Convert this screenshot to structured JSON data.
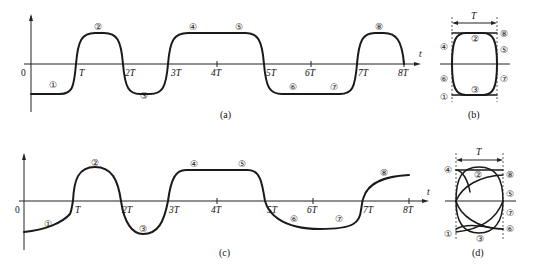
{
  "figure": {
    "panels": [
      {
        "id": "a",
        "caption": "(a)",
        "description": "Square-like wave with rounded transitions, time axis t"
      },
      {
        "id": "b",
        "caption": "(b)",
        "description": "Eye diagram overlay of one period T, rounded rectangle"
      },
      {
        "id": "c",
        "caption": "(c)",
        "description": "Distorted waveform with asymmetric transitions"
      },
      {
        "id": "d",
        "caption": "(d)",
        "description": "Eye diagram overlay of distorted waveform, period T"
      }
    ],
    "axis": {
      "origin": "0",
      "t_label": "t",
      "ticks": [
        "T",
        "2T",
        "3T",
        "4T",
        "5T",
        "6T",
        "7T",
        "8T"
      ]
    },
    "segment_markers": [
      "①",
      "②",
      "③",
      "④",
      "⑤",
      "⑥",
      "⑦",
      "⑧"
    ],
    "eye_period_label": "T"
  }
}
